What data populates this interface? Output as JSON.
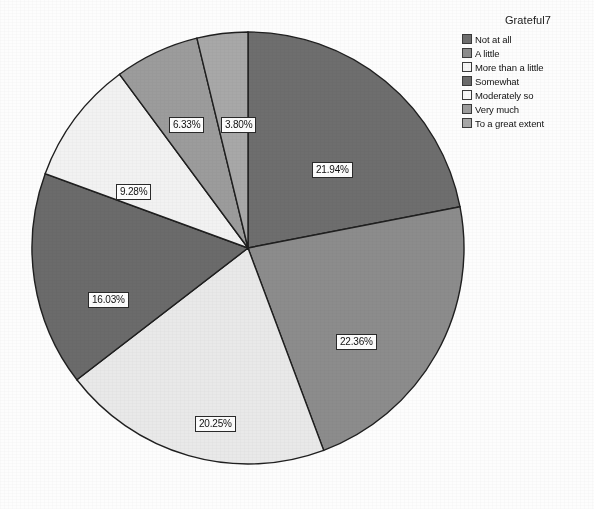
{
  "chart_data": {
    "type": "pie",
    "title": "",
    "legend_title": "Grateful7",
    "legend_position": "top-right",
    "grid": false,
    "units": "percent",
    "start_angle_deg": 0,
    "direction": "clockwise",
    "categories": [
      "Not at all",
      "A little",
      "More than a little",
      "Somewhat",
      "Moderately so",
      "Very much",
      "To a great extent"
    ],
    "values": [
      21.94,
      22.36,
      20.25,
      16.03,
      9.28,
      6.33,
      3.8
    ],
    "data_labels": [
      "21.94%",
      "22.36%",
      "20.25%",
      "16.03%",
      "9.28%",
      "6.33%",
      "3.80%"
    ],
    "colors": [
      "#6e6e6e",
      "#8c8c8c",
      "#e9e9e9",
      "#6b6b6b",
      "#f2f2f2",
      "#9c9c9c",
      "#a8a8a8"
    ],
    "slice_border_color": "#1f1f1f"
  },
  "legend": {
    "title": "Grateful7",
    "items": [
      {
        "label": "Not at all",
        "color": "#6e6e6e"
      },
      {
        "label": "A little",
        "color": "#8c8c8c"
      },
      {
        "label": "More than a little",
        "color": "#f4f4f4"
      },
      {
        "label": "Somewhat",
        "color": "#6b6b6b"
      },
      {
        "label": "Moderately so",
        "color": "#f7f7f7"
      },
      {
        "label": "Very much",
        "color": "#9c9c9c"
      },
      {
        "label": "To a great extent",
        "color": "#a8a8a8"
      }
    ]
  },
  "labels": {
    "s0": "21.94%",
    "s1": "22.36%",
    "s2": "20.25%",
    "s3": "16.03%",
    "s4": "9.28%",
    "s5": "6.33%",
    "s6": "3.80%"
  }
}
